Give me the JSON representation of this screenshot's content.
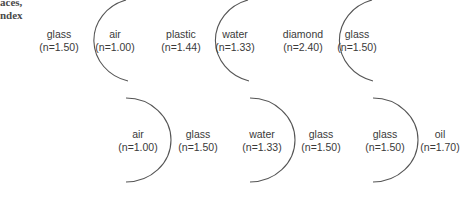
{
  "caption": {
    "line1": "aces,",
    "line2": "ndex"
  },
  "interfaces": [
    {
      "left": {
        "name": "glass",
        "n": "(n=1.50)"
      },
      "right": {
        "name": "air",
        "n": "(n=1.00)"
      },
      "curvature": "convex-left"
    },
    {
      "left": {
        "name": "plastic",
        "n": "(n=1.44)"
      },
      "right": {
        "name": "water",
        "n": "(n=1.33)"
      },
      "curvature": "convex-left"
    },
    {
      "left": {
        "name": "diamond",
        "n": "(n=2.40)"
      },
      "right": {
        "name": "glass",
        "n": "(n=1.50)"
      },
      "curvature": "convex-left"
    },
    {
      "left": {
        "name": "air",
        "n": "(n=1.00)"
      },
      "right": {
        "name": "glass",
        "n": "(n=1.50)"
      },
      "curvature": "convex-right"
    },
    {
      "left": {
        "name": "water",
        "n": "(n=1.33)"
      },
      "right": {
        "name": "glass",
        "n": "(n=1.50)"
      },
      "curvature": "convex-right"
    },
    {
      "left": {
        "name": "glass",
        "n": "(n=1.50)"
      },
      "right": {
        "name": "oil",
        "n": "(n=1.70)"
      },
      "curvature": "convex-right"
    }
  ],
  "colors": {
    "line": "#555555",
    "text": "#3a3a3a"
  }
}
